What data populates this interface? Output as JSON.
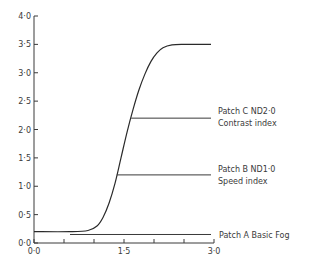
{
  "chart_data": {
    "type": "line",
    "title": "",
    "xlabel": "",
    "ylabel": "",
    "xlim": [
      0.0,
      3.0
    ],
    "ylim": [
      0.0,
      4.0
    ],
    "grid": false,
    "x_ticks": [
      0.0,
      0.5,
      1.0,
      1.5,
      2.0,
      2.5,
      3.0
    ],
    "x_tick_labels": [
      "0·0",
      "1·5",
      "3·0"
    ],
    "x_tick_label_values": [
      0.0,
      1.5,
      3.0
    ],
    "y_ticks": [
      0.0,
      0.5,
      1.0,
      1.5,
      2.0,
      2.5,
      3.0,
      3.5,
      4.0
    ],
    "y_tick_labels": [
      "0·0",
      "0·5",
      "1·0",
      "1·5",
      "2·0",
      "2·5",
      "3·0",
      "3·5",
      "4·0"
    ],
    "series": [
      {
        "name": "Characteristic curve",
        "x": [
          0.0,
          0.6,
          0.9,
          1.05,
          1.15,
          1.25,
          1.35,
          1.45,
          1.55,
          1.65,
          1.75,
          1.85,
          1.95,
          2.05,
          2.15,
          2.3,
          2.5,
          2.7,
          2.95
        ],
        "y": [
          0.2,
          0.2,
          0.22,
          0.3,
          0.45,
          0.7,
          1.05,
          1.5,
          1.95,
          2.35,
          2.7,
          2.98,
          3.2,
          3.35,
          3.44,
          3.49,
          3.5,
          3.5,
          3.5
        ]
      }
    ],
    "annotations": [
      {
        "label_lines": [
          "Patch C ND2·0",
          "Contrast index"
        ],
        "y": 2.2,
        "x_start": 1.62,
        "x_end": 2.95
      },
      {
        "label_lines": [
          "Patch B ND1·0",
          "Speed index"
        ],
        "y": 1.2,
        "x_start": 1.38,
        "x_end": 2.95
      },
      {
        "label_lines": [
          "Patch A Basic Fog"
        ],
        "y": 0.15,
        "x_start": 0.6,
        "x_end": 2.95
      }
    ]
  },
  "labels": {
    "patch_c_line1": "Patch C ND2·0",
    "patch_c_line2": "Contrast index",
    "patch_b_line1": "Patch B ND1·0",
    "patch_b_line2": "Speed index",
    "patch_a": "Patch A Basic Fog"
  }
}
